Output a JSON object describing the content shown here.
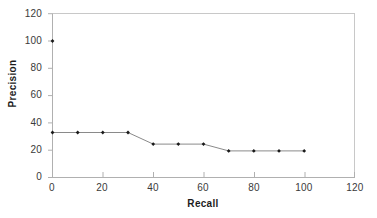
{
  "chart_data": {
    "type": "line",
    "title": "",
    "subtitle": "",
    "xlabel": "Recall",
    "ylabel": "Precision",
    "xlim": [
      0,
      120
    ],
    "ylim": [
      0,
      120
    ],
    "xticks": [
      0,
      20,
      40,
      60,
      80,
      100,
      120
    ],
    "yticks": [
      0,
      20,
      40,
      60,
      80,
      100,
      120
    ],
    "xtick_labels": [
      "0",
      "20",
      "40",
      "60",
      "80",
      "100",
      "120"
    ],
    "ytick_labels": [
      "0",
      "20",
      "40",
      "60",
      "80",
      "100",
      "120"
    ],
    "grid": false,
    "legend": null,
    "legend_position": "none",
    "marker": "diamond",
    "marker_color": "#1a1a1a",
    "line_color": "#8a8a8a",
    "axis_color": "#b3b3b3",
    "plot_background": "#ffffff",
    "series": [
      {
        "name": "Precision vs Recall",
        "x": [
          0,
          0,
          10,
          20,
          30,
          40,
          50,
          60,
          70,
          80,
          90,
          100
        ],
        "y": [
          100,
          33,
          33,
          33,
          33,
          24.5,
          24.5,
          24.5,
          19.5,
          19.5,
          19.5,
          19.5
        ]
      }
    ],
    "points": [
      {
        "x": 0,
        "y": 100
      },
      {
        "x": 0,
        "y": 33
      },
      {
        "x": 10,
        "y": 33
      },
      {
        "x": 20,
        "y": 33
      },
      {
        "x": 30,
        "y": 33
      },
      {
        "x": 40,
        "y": 24.5
      },
      {
        "x": 50,
        "y": 24.5
      },
      {
        "x": 60,
        "y": 24.5
      },
      {
        "x": 70,
        "y": 19.5
      },
      {
        "x": 80,
        "y": 19.5
      },
      {
        "x": 90,
        "y": 19.5
      },
      {
        "x": 100,
        "y": 19.5
      }
    ],
    "annotations": []
  }
}
